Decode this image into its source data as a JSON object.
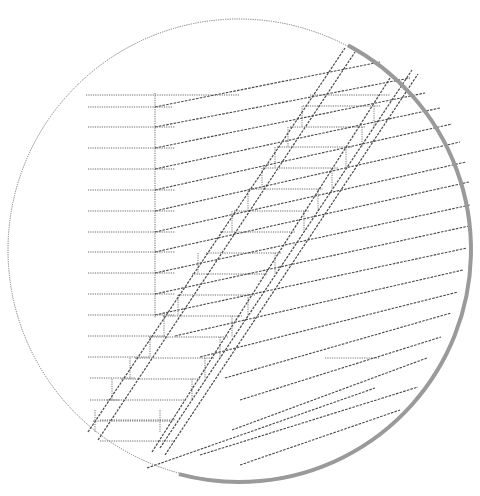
{
  "diagram": {
    "kind": "stair-in-circle line drawing",
    "canvas": {
      "width": 480,
      "height": 496,
      "background": "#ffffff"
    },
    "colors": {
      "line": "#6a6a6a",
      "dark_line": "#4a4a4a",
      "rim_shade": "#9a9a9a"
    },
    "circle": {
      "cx": 239,
      "cy": 250,
      "r": 231
    },
    "rim_shade_arc": {
      "from_deg": -62,
      "to_deg": 105,
      "width": 4
    },
    "vertical_line": {
      "x": 155,
      "y1": 93,
      "y2": 318
    },
    "horizontal_lines": [
      {
        "x1": 86,
        "x2": 240,
        "y": 95
      },
      {
        "x1": 88,
        "x2": 172,
        "y": 107
      },
      {
        "x1": 88,
        "x2": 175,
        "y": 127
      },
      {
        "x1": 88,
        "x2": 175,
        "y": 148
      },
      {
        "x1": 88,
        "x2": 175,
        "y": 169
      },
      {
        "x1": 88,
        "x2": 175,
        "y": 190
      },
      {
        "x1": 88,
        "x2": 175,
        "y": 211
      },
      {
        "x1": 88,
        "x2": 175,
        "y": 232
      },
      {
        "x1": 88,
        "x2": 175,
        "y": 252
      },
      {
        "x1": 88,
        "x2": 175,
        "y": 273
      },
      {
        "x1": 88,
        "x2": 175,
        "y": 294
      },
      {
        "x1": 88,
        "x2": 175,
        "y": 315
      },
      {
        "x1": 88,
        "x2": 165,
        "y": 336
      },
      {
        "x1": 88,
        "x2": 150,
        "y": 357
      },
      {
        "x1": 90,
        "x2": 135,
        "y": 378
      },
      {
        "x1": 90,
        "x2": 120,
        "y": 400
      },
      {
        "x1": 100,
        "x2": 175,
        "y": 420
      },
      {
        "x1": 100,
        "x2": 175,
        "y": 441
      }
    ],
    "slanted_lines": [
      {
        "x1": 155,
        "y1": 107,
        "x2": 380,
        "y2": 62
      },
      {
        "x1": 155,
        "y1": 127,
        "x2": 410,
        "y2": 78
      },
      {
        "x1": 155,
        "y1": 148,
        "x2": 425,
        "y2": 93
      },
      {
        "x1": 155,
        "y1": 169,
        "x2": 440,
        "y2": 108
      },
      {
        "x1": 155,
        "y1": 190,
        "x2": 452,
        "y2": 124
      },
      {
        "x1": 155,
        "y1": 211,
        "x2": 460,
        "y2": 142
      },
      {
        "x1": 155,
        "y1": 232,
        "x2": 466,
        "y2": 162
      },
      {
        "x1": 155,
        "y1": 252,
        "x2": 469,
        "y2": 182
      },
      {
        "x1": 155,
        "y1": 273,
        "x2": 470,
        "y2": 205
      },
      {
        "x1": 155,
        "y1": 294,
        "x2": 469,
        "y2": 226
      },
      {
        "x1": 155,
        "y1": 315,
        "x2": 467,
        "y2": 248
      },
      {
        "x1": 175,
        "y1": 336,
        "x2": 463,
        "y2": 270
      },
      {
        "x1": 200,
        "y1": 357,
        "x2": 458,
        "y2": 292
      },
      {
        "x1": 225,
        "y1": 378,
        "x2": 451,
        "y2": 313
      },
      {
        "x1": 240,
        "y1": 400,
        "x2": 441,
        "y2": 337
      },
      {
        "x1": 232,
        "y1": 430,
        "x2": 427,
        "y2": 358
      },
      {
        "x1": 200,
        "y1": 455,
        "x2": 418,
        "y2": 387
      },
      {
        "x1": 240,
        "y1": 465,
        "x2": 400,
        "y2": 410
      },
      {
        "x1": 147,
        "y1": 468,
        "x2": 375,
        "y2": 388
      }
    ],
    "short_horizontal_marker": {
      "x1": 325,
      "x2": 380,
      "y": 358
    },
    "stair_rails": [
      {
        "x1": 88,
        "y1": 432,
        "x2": 345,
        "y2": 48
      },
      {
        "x1": 98,
        "y1": 440,
        "x2": 355,
        "y2": 52
      },
      {
        "x1": 152,
        "y1": 452,
        "x2": 390,
        "y2": 78
      },
      {
        "x1": 160,
        "y1": 448,
        "x2": 412,
        "y2": 70
      },
      {
        "x1": 165,
        "y1": 455,
        "x2": 418,
        "y2": 74
      }
    ],
    "stair_treads": [
      {
        "x1": 310,
        "y1": 95,
        "x2": 390,
        "y2": 95
      },
      {
        "x1": 303,
        "y1": 106,
        "x2": 380,
        "y2": 106
      },
      {
        "x1": 290,
        "y1": 127,
        "x2": 365,
        "y2": 127
      },
      {
        "x1": 277,
        "y1": 147,
        "x2": 352,
        "y2": 147
      },
      {
        "x1": 263,
        "y1": 168,
        "x2": 338,
        "y2": 168
      },
      {
        "x1": 249,
        "y1": 189,
        "x2": 323,
        "y2": 189
      },
      {
        "x1": 234,
        "y1": 211,
        "x2": 309,
        "y2": 211
      },
      {
        "x1": 220,
        "y1": 232,
        "x2": 295,
        "y2": 232
      },
      {
        "x1": 206,
        "y1": 253,
        "x2": 282,
        "y2": 253
      },
      {
        "x1": 192,
        "y1": 274,
        "x2": 268,
        "y2": 274
      },
      {
        "x1": 178,
        "y1": 295,
        "x2": 255,
        "y2": 295
      },
      {
        "x1": 163,
        "y1": 316,
        "x2": 242,
        "y2": 316
      },
      {
        "x1": 149,
        "y1": 337,
        "x2": 228,
        "y2": 337
      },
      {
        "x1": 135,
        "y1": 358,
        "x2": 214,
        "y2": 358
      },
      {
        "x1": 121,
        "y1": 379,
        "x2": 200,
        "y2": 379
      },
      {
        "x1": 107,
        "y1": 400,
        "x2": 186,
        "y2": 400
      },
      {
        "x1": 93,
        "y1": 421,
        "x2": 173,
        "y2": 421
      }
    ],
    "stair_risers": [
      {
        "x": 302,
        "y1": 106,
        "y2": 127
      },
      {
        "x": 374,
        "y1": 106,
        "y2": 127
      },
      {
        "x": 288,
        "y1": 127,
        "y2": 147
      },
      {
        "x": 362,
        "y1": 127,
        "y2": 147
      },
      {
        "x": 275,
        "y1": 147,
        "y2": 168
      },
      {
        "x": 346,
        "y1": 147,
        "y2": 168
      },
      {
        "x": 262,
        "y1": 168,
        "y2": 189
      },
      {
        "x": 332,
        "y1": 168,
        "y2": 189
      },
      {
        "x": 248,
        "y1": 189,
        "y2": 211
      },
      {
        "x": 318,
        "y1": 189,
        "y2": 211
      },
      {
        "x": 232,
        "y1": 211,
        "y2": 232
      },
      {
        "x": 304,
        "y1": 211,
        "y2": 232
      },
      {
        "x": 198,
        "y1": 253,
        "y2": 274
      },
      {
        "x": 275,
        "y1": 253,
        "y2": 274
      },
      {
        "x": 178,
        "y1": 295,
        "y2": 316
      },
      {
        "x": 248,
        "y1": 295,
        "y2": 316
      },
      {
        "x": 164,
        "y1": 316,
        "y2": 337
      },
      {
        "x": 232,
        "y1": 316,
        "y2": 337
      },
      {
        "x": 150,
        "y1": 337,
        "y2": 358
      },
      {
        "x": 220,
        "y1": 337,
        "y2": 358
      },
      {
        "x": 130,
        "y1": 358,
        "y2": 379
      },
      {
        "x": 205,
        "y1": 358,
        "y2": 379
      },
      {
        "x": 112,
        "y1": 379,
        "y2": 400
      },
      {
        "x": 192,
        "y1": 379,
        "y2": 400
      },
      {
        "x": 95,
        "y1": 410,
        "y2": 432
      },
      {
        "x": 160,
        "y1": 410,
        "y2": 432
      }
    ]
  }
}
